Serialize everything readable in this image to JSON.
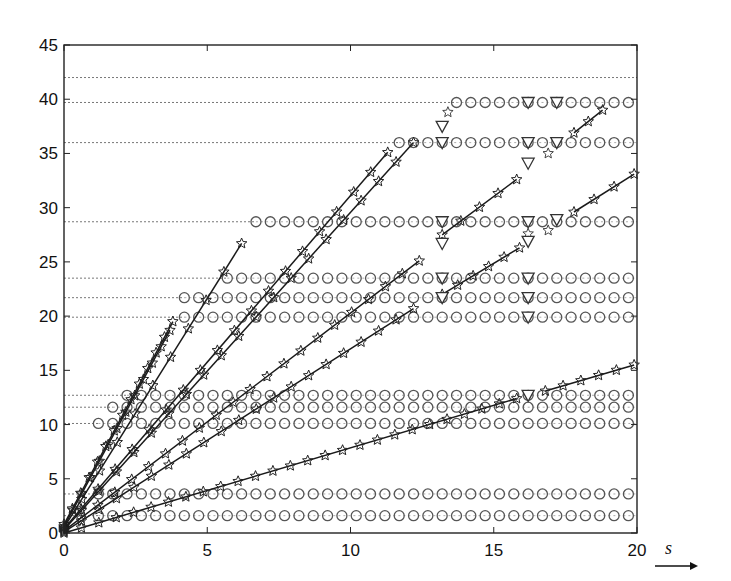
{
  "chart_data": {
    "type": "scatter",
    "title": "",
    "xlabel": "s",
    "ylabel": "",
    "xlim": [
      0,
      20
    ],
    "ylim": [
      0,
      45
    ],
    "xticks": [
      0,
      5,
      10,
      15,
      20
    ],
    "yticks": [
      0,
      5,
      10,
      15,
      20,
      25,
      30,
      35,
      40,
      45
    ],
    "grid": false,
    "legend": null,
    "levels": [
      {
        "y": 42.0,
        "circles_from": null
      },
      {
        "y": 39.7,
        "circles_from": 13.7
      },
      {
        "y": 36.0,
        "circles_from": 11.7
      },
      {
        "y": 28.7,
        "circles_from": 6.7
      },
      {
        "y": 23.5,
        "circles_from": 5.7
      },
      {
        "y": 21.7,
        "circles_from": 4.2
      },
      {
        "y": 19.9,
        "circles_from": 4.2
      },
      {
        "y": 12.7,
        "circles_from": 2.2
      },
      {
        "y": 11.6,
        "circles_from": 1.7
      },
      {
        "y": 10.1,
        "circles_from": 1.2
      },
      {
        "y": 3.6,
        "circles_from": 1.2
      },
      {
        "y": 1.6,
        "circles_from": 1.2
      }
    ],
    "circle_step": 0.5,
    "series": [
      {
        "name": "L1",
        "segments": [
          [
            [
              0,
              0.8
            ],
            [
              3.8,
              19.5
            ]
          ]
        ],
        "step": 0.3
      },
      {
        "name": "L2",
        "segments": [
          [
            [
              0,
              0.6
            ],
            [
              3.7,
              18.7
            ]
          ]
        ],
        "step": 0.3
      },
      {
        "name": "L3",
        "segments": [
          [
            [
              0,
              0.5
            ],
            [
              6.2,
              26.7
            ]
          ]
        ],
        "step": 0.6
      },
      {
        "name": "L4",
        "segments": [
          [
            [
              0,
              0.4
            ],
            [
              11.3,
              35.1
            ]
          ]
        ],
        "step": 0.6
      },
      {
        "name": "L5",
        "segments": [
          [
            [
              0,
              0.3
            ],
            [
              12.2,
              36.0
            ]
          ]
        ],
        "step": 0.6
      },
      {
        "name": "L6",
        "segments": [
          [
            [
              0,
              0.2
            ],
            [
              12.4,
              25.1
            ]
          ],
          [
            [
              13.2,
              27.5
            ],
            [
              15.8,
              32.6
            ]
          ],
          [
            [
              17.8,
              36.9
            ],
            [
              18.8,
              39.0
            ]
          ]
        ],
        "step": 0.6
      },
      {
        "name": "L7",
        "segments": [
          [
            [
              0,
              0.1
            ],
            [
              12.2,
              20.7
            ]
          ],
          [
            [
              13.2,
              22.0
            ],
            [
              15.9,
              26.3
            ]
          ],
          [
            [
              17.8,
              29.6
            ],
            [
              19.9,
              33.1
            ]
          ]
        ],
        "step": 0.6
      },
      {
        "name": "L8",
        "segments": [
          [
            [
              0,
              0.0
            ],
            [
              15.8,
              12.4
            ]
          ],
          [
            [
              16.8,
              13.1
            ],
            [
              19.9,
              15.5
            ]
          ]
        ],
        "step": 0.6
      }
    ],
    "isolated_stars": [
      [
        13.4,
        38.8
      ],
      [
        16.9,
        35.0
      ],
      [
        16.2,
        27.6
      ],
      [
        16.9,
        27.9
      ]
    ],
    "triangles": [
      [
        13.2,
        37.5
      ],
      [
        13.2,
        36.0
      ],
      [
        16.2,
        39.7
      ],
      [
        17.2,
        39.7
      ],
      [
        17.2,
        36.0
      ],
      [
        16.2,
        36.0
      ],
      [
        16.2,
        34.1
      ],
      [
        13.2,
        28.7
      ],
      [
        13.2,
        26.7
      ],
      [
        16.2,
        28.7
      ],
      [
        17.2,
        28.9
      ],
      [
        16.2,
        26.9
      ],
      [
        13.2,
        23.5
      ],
      [
        13.2,
        21.7
      ],
      [
        16.2,
        23.5
      ],
      [
        16.2,
        21.7
      ],
      [
        16.2,
        19.9
      ],
      [
        16.2,
        12.7
      ]
    ]
  },
  "axis": {
    "x_tick_labels": [
      "0",
      "5",
      "10",
      "15",
      "20"
    ],
    "y_tick_labels": [
      "0",
      "5",
      "10",
      "15",
      "20",
      "25",
      "30",
      "35",
      "40",
      "45"
    ],
    "x_label": "s"
  }
}
